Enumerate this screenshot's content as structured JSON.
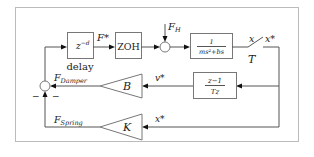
{
  "diagram": {
    "type": "block-diagram",
    "blocks": {
      "delay": {
        "expr_base": "z",
        "expr_exp": "−d",
        "caption": "delay"
      },
      "zoh": {
        "label": "ZOH"
      },
      "plant": {
        "num": "1",
        "den": "ms²+bs"
      },
      "diff": {
        "num": "z−1",
        "den": "Tz"
      },
      "damper_gain": {
        "label": "B"
      },
      "spring_gain": {
        "label": "K"
      }
    },
    "signals": {
      "f_star": "F*",
      "f_h": "F",
      "f_h_sub": "H",
      "x": "x",
      "x_star_top": "x*",
      "sample_period": "T",
      "v_star": "v*",
      "x_star_bottom": "x*",
      "f_damper": "F",
      "f_damper_sub": "Damper",
      "f_spring": "F",
      "f_spring_sub": "Spring"
    },
    "summing_signs": {
      "left_a": "−",
      "left_b": "−"
    }
  }
}
